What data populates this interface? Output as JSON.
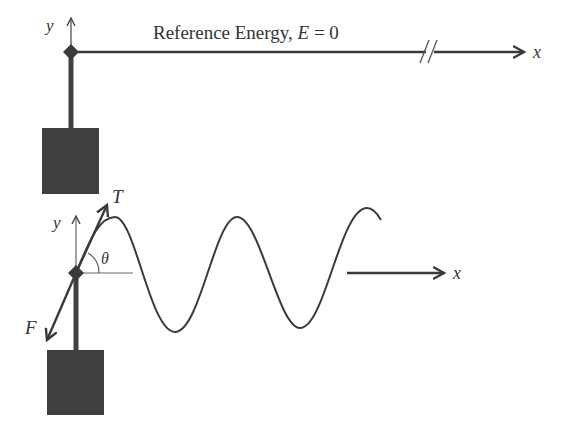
{
  "colors": {
    "ink": "#3a3a3a",
    "mass": "#404040",
    "thin": "#555555",
    "background": "#ffffff"
  },
  "top_panel": {
    "y_axis_label": "y",
    "x_axis_label": "x",
    "reference_label_prefix": "Reference Energy, ",
    "reference_label_var": "E",
    "reference_label_suffix": " = 0",
    "axis_break": "//"
  },
  "bottom_panel": {
    "y_axis_label": "y",
    "x_axis_label": "x",
    "tension_label": "T",
    "force_label": "F",
    "angle_label": "θ",
    "wave": {
      "start": [
        76,
        273
      ],
      "peaks": [
        [
          115,
          217
        ],
        [
          237,
          217
        ],
        [
          367,
          208
        ]
      ],
      "troughs": [
        [
          175,
          332
        ],
        [
          300,
          328
        ]
      ],
      "end": [
        381,
        220
      ]
    }
  }
}
